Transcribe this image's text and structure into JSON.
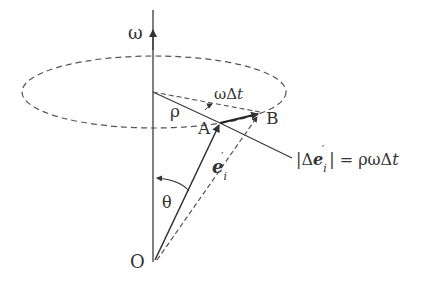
{
  "diagram": {
    "labels": {
      "omega_axis": "ω",
      "omega_dt": "ωΔ",
      "omega_dt_t": "t",
      "rho": "ρ",
      "point_A": "A",
      "point_B": "B",
      "point_O": "O",
      "theta": "θ",
      "vector_e": "e",
      "vector_e_sub": "i",
      "vector_e_prime": "′",
      "equation_left_bar": "|Δ",
      "equation_e": "e",
      "equation_e_sub": "i",
      "equation_e_prime": "′",
      "equation_rest": "| = ρωΔ",
      "equation_t": "t"
    },
    "colors": {
      "line": "#3a3a3a",
      "dashed": "#5a5a5a",
      "text": "#333333"
    }
  }
}
